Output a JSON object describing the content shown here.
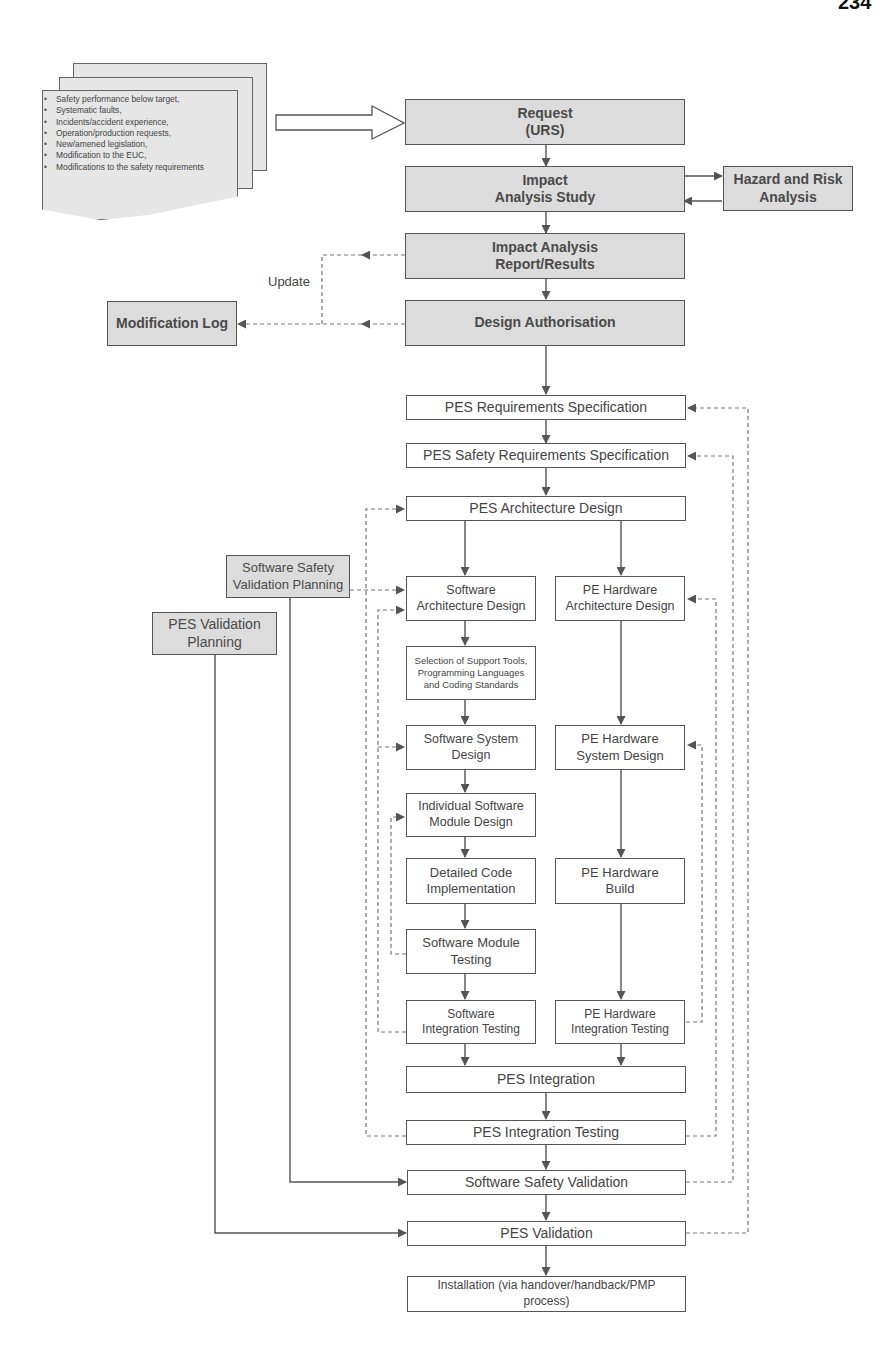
{
  "page": {
    "number": "234"
  },
  "triggers": {
    "items": [
      "Safety performance below target,",
      "Systematic faults,",
      "Incidents/accident experience,",
      "Operation/production requests,",
      "New/amened legislation,",
      "Modification to the EUC,",
      "Modifications to the safety requirements"
    ]
  },
  "nodes": {
    "request": "Request\n(URS)",
    "impact_study": "Impact\nAnalysis Study",
    "hazard_risk": "Hazard and Risk\nAnalysis",
    "impact_report": "Impact Analysis\nReport/Results",
    "design_auth": "Design Authorisation",
    "mod_log": "Modification Log",
    "update_label": "Update",
    "pes_req": "PES Requirements Specification",
    "pes_safety_req": "PES Safety Requirements Specification",
    "pes_arch": "PES Architecture Design",
    "sw_safety_val_plan": "Software Safety\nValidation Planning",
    "pes_val_plan": "PES Validation\nPlanning",
    "sw_arch": "Software\nArchitecture Design",
    "pe_hw_arch": "PE Hardware\nArchitecture Design",
    "support_tools": "Selection of Support Tools,\nProgramming Languages\nand Coding Standards",
    "sw_system": "Software System\nDesign",
    "pe_hw_system": "PE Hardware\nSystem Design",
    "sw_module_design": "Individual Software\nModule Design",
    "code_impl": "Detailed Code\nImplementation",
    "pe_hw_build": "PE Hardware\nBuild",
    "sw_module_test": "Software Module\nTesting",
    "sw_integ_test": "Software\nIntegration Testing",
    "pe_hw_integ_test": "PE Hardware\nIntegration Testing",
    "pes_integration": "PES Integration",
    "pes_integ_test": "PES Integration Testing",
    "sw_safety_val": "Software Safety Validation",
    "pes_validation": "PES Validation",
    "installation": "Installation (via handover/handback/PMP\nprocess)"
  },
  "colors": {
    "shaded_fill": "#dcdcdc",
    "line": "#555555",
    "dashed": "#777777"
  }
}
